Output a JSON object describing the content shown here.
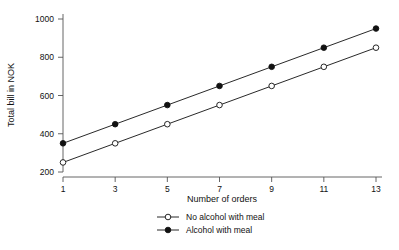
{
  "chart_data": {
    "type": "line",
    "title": "",
    "xlabel": "Number of orders",
    "ylabel": "Total bill in NOK",
    "x": [
      1,
      3,
      5,
      7,
      9,
      11,
      13
    ],
    "xticklabels": [
      "1",
      "3",
      "5",
      "7",
      "9",
      "11",
      "13"
    ],
    "yticks": [
      200,
      400,
      600,
      800,
      1000
    ],
    "yticklabels": [
      "200",
      "400",
      "600",
      "800",
      "1000"
    ],
    "xlim": [
      1,
      13
    ],
    "ylim": [
      200,
      1000
    ],
    "grid": false,
    "legend_position": "bottom-center",
    "series": [
      {
        "name": "No alcohol with meal",
        "marker": "open-circle",
        "color": "#111111",
        "values": [
          250,
          350,
          450,
          550,
          650,
          750,
          850
        ]
      },
      {
        "name": "Alcohol with meal",
        "marker": "filled-circle",
        "color": "#111111",
        "values": [
          350,
          450,
          550,
          650,
          750,
          850,
          950
        ]
      }
    ]
  },
  "legend": {
    "items": [
      {
        "label": "No alcohol with meal",
        "marker": "open-circle"
      },
      {
        "label": "Alcohol with meal",
        "marker": "filled-circle"
      }
    ]
  },
  "axes": {
    "x_title": "Number of orders",
    "y_title": "Total bill in NOK"
  }
}
